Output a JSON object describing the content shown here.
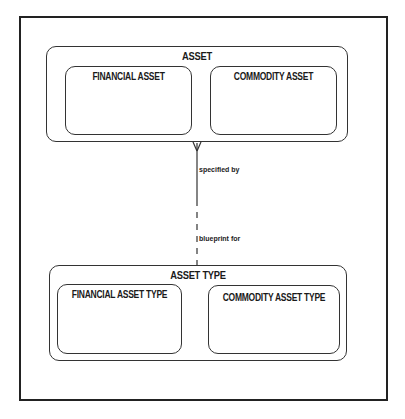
{
  "diagram": {
    "entities": [
      {
        "id": "asset",
        "label": "ASSET",
        "subtypes": [
          {
            "label": "FINANCIAL ASSET"
          },
          {
            "label": "COMMODITY ASSET"
          }
        ]
      },
      {
        "id": "asset_type",
        "label": "ASSET TYPE",
        "subtypes": [
          {
            "label": "FINANCIAL ASSET TYPE"
          },
          {
            "label": "COMMODITY ASSET TYPE"
          }
        ]
      }
    ],
    "relationship": {
      "from": "ASSET",
      "to": "ASSET TYPE",
      "from_label": "specified by",
      "to_label": "blueprint for",
      "from_cardinality": "many (crow's foot)",
      "from_optionality": "mandatory (solid)",
      "to_optionality": "optional (dashed)"
    }
  }
}
